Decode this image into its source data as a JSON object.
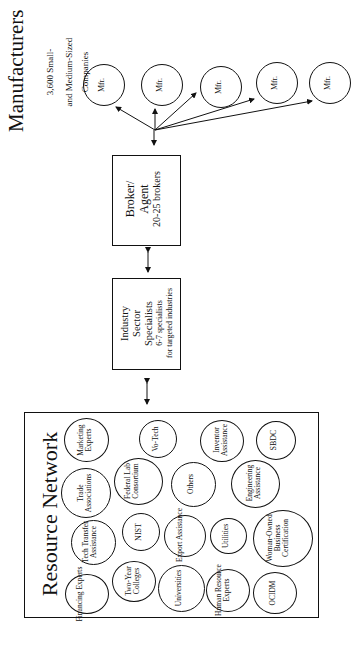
{
  "manufacturers": {
    "title": "Manufacturers",
    "subtitle_line1": "3,600  Small-",
    "subtitle_line2": "and  Medium-Sized",
    "subtitle_line3": "Companies",
    "mfr_label": "Mfr.",
    "mfr_nodes": [
      "Mfr.",
      "Mfr.",
      "Mfr.",
      "Mfr.",
      "Mfr."
    ]
  },
  "broker": {
    "line1": "Broker/",
    "line2": "Agent",
    "line3": "20-25  brokers"
  },
  "industry": {
    "line1": "Industry",
    "line2": "Sector",
    "line3": "Specialists",
    "line4": "6-7  specialists",
    "line5": "for  targeted  industries"
  },
  "resource_network": {
    "title": "Resource  Network",
    "nodes": [
      {
        "label": "Financing Experts"
      },
      {
        "label": "Tech Transfer Assistance"
      },
      {
        "label": "Trade Associations"
      },
      {
        "label": "Marketing Experts"
      },
      {
        "label": "Two-Year Colleges"
      },
      {
        "label": "NIST"
      },
      {
        "label": "Federal Lab Consortium"
      },
      {
        "label": "Vo-Tech"
      },
      {
        "label": "Universities"
      },
      {
        "label": "Export Assistance"
      },
      {
        "label": "Others"
      },
      {
        "label": "Inventor Assistance"
      },
      {
        "label": "Human Resource Experts"
      },
      {
        "label": "Utilities"
      },
      {
        "label": "Engineering Assistance"
      },
      {
        "label": "SBDC"
      },
      {
        "label": "OCIDM"
      },
      {
        "label": "Woman-Owned Business Certification"
      }
    ]
  },
  "colors": {
    "line": "#111111",
    "background": "#ffffff"
  }
}
